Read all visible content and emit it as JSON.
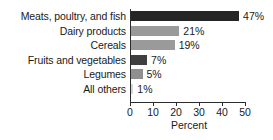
{
  "chart_data": {
    "type": "bar",
    "orientation": "horizontal",
    "title": "",
    "subtitle": "",
    "xlabel": "Percent",
    "ylabel": "",
    "categories": [
      "Meats, poultry, and fish",
      "Dairy products",
      "Cereals",
      "Fruits and vegetables",
      "Legumes",
      "All others"
    ],
    "values": [
      47,
      21,
      19,
      7,
      5,
      1
    ],
    "data_labels": [
      "47%",
      "21%",
      "19%",
      "7%",
      "5%",
      "1%"
    ],
    "bar_colors": [
      "#252525",
      "#9a9a9a",
      "#9a9a9a",
      "#3f3f3f",
      "#8f8f8f",
      "#d8d8d8"
    ],
    "xlim": [
      0,
      50
    ],
    "xticks": [
      0,
      10,
      20,
      30,
      40,
      50
    ],
    "xtick_labels": [
      "0",
      "10",
      "20",
      "30",
      "40",
      "50"
    ],
    "grid": false,
    "legend": false,
    "legend_position": "none"
  }
}
